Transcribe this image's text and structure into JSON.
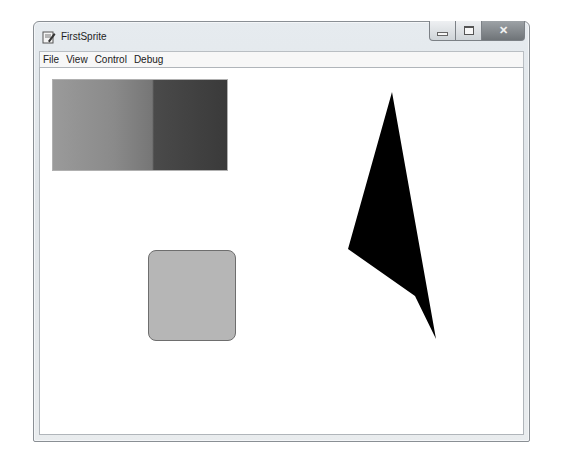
{
  "window": {
    "title": "FirstSprite",
    "icon": "app-document-pen-icon",
    "caption_buttons": {
      "minimize": "minimize-icon",
      "maximize": "maximize-icon",
      "close": "close-icon",
      "close_glyph": "✕"
    }
  },
  "menubar": {
    "items": [
      {
        "label": "File"
      },
      {
        "label": "View"
      },
      {
        "label": "Control"
      },
      {
        "label": "Debug"
      }
    ]
  },
  "canvas": {
    "background": "#ffffff",
    "sprites": [
      {
        "name": "gradient-rectangle",
        "type": "rectangle",
        "fill": "horizontal gray gradient",
        "colors": [
          "#9a9a9a",
          "#767676",
          "#4a4a4a",
          "#3a3a3a"
        ]
      },
      {
        "name": "rounded-square",
        "type": "rounded-rectangle",
        "fill": "#b6b6b6",
        "stroke": "#6e6e6e"
      },
      {
        "name": "black-polygon",
        "type": "polygon",
        "fill": "#000000",
        "points": "352,24 308,181 375,228 396,271"
      }
    ]
  }
}
